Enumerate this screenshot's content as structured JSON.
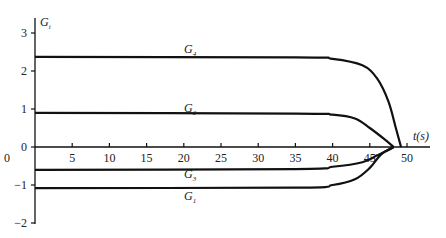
{
  "chart_data": {
    "type": "line",
    "title": "",
    "xlabel": "t(s)",
    "ylabel": "G_i",
    "xlim": [
      0,
      52
    ],
    "ylim": [
      -2,
      3.2
    ],
    "x_ticks": [
      "0",
      "5",
      "10",
      "15",
      "20",
      "25",
      "30",
      "35",
      "40",
      "45",
      "50"
    ],
    "y_ticks": [
      "3",
      "2",
      "1",
      "0",
      "-1",
      "-2"
    ],
    "grid": false,
    "legend": "inline labels",
    "series": [
      {
        "name": "G4",
        "x": [
          0,
          35,
          40,
          44,
          46,
          47.5,
          48.5,
          49.2
        ],
        "values": [
          2.37,
          2.36,
          2.32,
          2.15,
          1.8,
          1.2,
          0.5,
          0
        ]
      },
      {
        "name": "G2",
        "x": [
          0,
          35,
          40,
          43,
          45,
          47,
          48.2
        ],
        "values": [
          0.9,
          0.88,
          0.85,
          0.75,
          0.5,
          0.2,
          0
        ]
      },
      {
        "name": "G3",
        "x": [
          0,
          35,
          40,
          44,
          46,
          47.5,
          48.2
        ],
        "values": [
          -0.6,
          -0.58,
          -0.52,
          -0.4,
          -0.22,
          -0.08,
          0
        ]
      },
      {
        "name": "G1",
        "x": [
          0,
          35,
          40,
          43,
          45,
          46.5,
          48.2
        ],
        "values": [
          -1.08,
          -1.07,
          -1.0,
          -0.85,
          -0.55,
          -0.2,
          0
        ]
      }
    ]
  },
  "labels": {
    "y_axis": "G",
    "y_axis_sub": "i",
    "x_axis": "t(s)",
    "g4": "G",
    "g4_sub": "4",
    "g2": "G",
    "g2_sub": "2",
    "g3": "G",
    "g3_sub": "3",
    "g1": "G",
    "g1_sub": "1",
    "origin_x": "0"
  }
}
